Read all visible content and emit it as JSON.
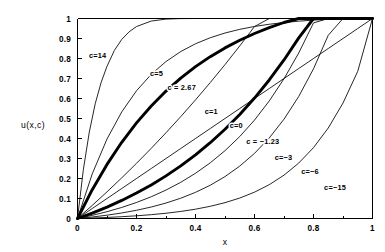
{
  "figure": {
    "name": "utility-function-family-plot",
    "background_color": "#ffffff",
    "foreground_color": "#000000"
  },
  "chart_data": {
    "type": "line",
    "title": "",
    "subtitle": "",
    "xlabel": "x",
    "ylabel": "u(x,c)",
    "xlim": [
      0,
      1
    ],
    "ylim": [
      0,
      1
    ],
    "grid": false,
    "legend_position": "inline-curve-labels",
    "x_ticks": [
      "0",
      "0.2",
      "0.4",
      "0.6",
      "0.8",
      "1"
    ],
    "x_tick_values": [
      0,
      0.2,
      0.4,
      0.6,
      0.8,
      1
    ],
    "x_minor_tick_values": [
      0.1,
      0.3,
      0.5,
      0.7,
      0.9
    ],
    "y_ticks": [
      "0",
      "0.1",
      "0.2",
      "0.3",
      "0.4",
      "0.5",
      "0.6",
      "0.7",
      "0.8",
      "0.9",
      "1"
    ],
    "y_tick_values": [
      0,
      0.1,
      0.2,
      0.3,
      0.4,
      0.5,
      0.6,
      0.7,
      0.8,
      0.9,
      1
    ],
    "series": [
      {
        "name": "c=14",
        "label": "c=14",
        "c": 14,
        "bold": false,
        "label_x": 0.075,
        "label_y": 0.805,
        "label_dx": -2,
        "label_dy": 0,
        "x": [
          0,
          0.02,
          0.04,
          0.06,
          0.08,
          0.1,
          0.125,
          0.15,
          0.175,
          0.2,
          0.25,
          0.3,
          0.35,
          0.4,
          0.45,
          0.5,
          0.6,
          0.7,
          0.8,
          0.9,
          1
        ],
        "y": [
          0,
          0.2461,
          0.4323,
          0.5733,
          0.68,
          0.7608,
          0.8405,
          0.8955,
          0.9335,
          0.9598,
          0.9873,
          0.997,
          0.9996,
          1.0,
          1.0,
          1.0,
          1.0,
          1.0,
          1.0,
          1.0,
          1.0
        ]
      },
      {
        "name": "c=5",
        "label": "c=5",
        "c": 5,
        "bold": false,
        "label_x": 0.275,
        "label_y": 0.715,
        "label_dx": -2,
        "label_dy": 0,
        "x": [
          0,
          0.05,
          0.1,
          0.15,
          0.2,
          0.25,
          0.3,
          0.35,
          0.4,
          0.45,
          0.5,
          0.55,
          0.6,
          0.65,
          0.7,
          0.75,
          0.8,
          0.85,
          0.9,
          0.95,
          1
        ],
        "y": [
          0,
          0.2235,
          0.3975,
          0.5331,
          0.6387,
          0.7209,
          0.7849,
          0.8348,
          0.8736,
          0.9039,
          0.9274,
          0.9458,
          0.9601,
          0.9712,
          0.9799,
          0.9866,
          0.9919,
          0.996,
          0.9992,
          1.0,
          1.0
        ]
      },
      {
        "name": "c=2.67",
        "label": "c = 2.67",
        "c": 2.67,
        "bold": true,
        "label_x": 0.36,
        "label_y": 0.645,
        "label_dx": -2,
        "label_dy": 0,
        "x": [
          0,
          0.05,
          0.1,
          0.15,
          0.2,
          0.25,
          0.3,
          0.35,
          0.4,
          0.45,
          0.5,
          0.55,
          0.6,
          0.65,
          0.7,
          0.75,
          0.8,
          0.85,
          0.9,
          0.95,
          1
        ],
        "y": [
          0,
          0.1442,
          0.2705,
          0.3811,
          0.478,
          0.5628,
          0.6372,
          0.7023,
          0.7594,
          0.8093,
          0.853,
          0.8913,
          0.9249,
          0.9543,
          0.98,
          1.0026,
          1.0223,
          1.0396,
          1.0548,
          1.0681,
          1.0
        ]
      },
      {
        "name": "c=1",
        "label": "c=1",
        "c": 1,
        "bold": false,
        "label_x": 0.46,
        "label_y": 0.525,
        "label_dx": -2,
        "label_dy": 0,
        "x": [
          0,
          0.05,
          0.1,
          0.15,
          0.2,
          0.25,
          0.3,
          0.35,
          0.4,
          0.45,
          0.5,
          0.55,
          0.6,
          0.65,
          0.7,
          0.75,
          0.8,
          0.85,
          0.9,
          0.95,
          1
        ],
        "y": [
          0,
          0.0656,
          0.1333,
          0.2034,
          0.2759,
          0.351,
          0.4288,
          0.5094,
          0.593,
          0.6797,
          0.7696,
          0.8629,
          0.9598,
          1.0,
          1.0,
          1.0,
          1.0,
          1.0,
          1.0,
          1.0,
          1.0
        ]
      },
      {
        "name": "c=0",
        "label": "c=0",
        "c": 0,
        "bold": false,
        "label_x": 0.545,
        "label_y": 0.455,
        "label_dx": -2,
        "label_dy": 0,
        "x": [
          0,
          0.05,
          0.1,
          0.15,
          0.2,
          0.25,
          0.3,
          0.35,
          0.4,
          0.45,
          0.5,
          0.55,
          0.6,
          0.65,
          0.7,
          0.75,
          0.8,
          0.85,
          0.9,
          0.95,
          1
        ],
        "y": [
          0,
          0.05,
          0.1,
          0.15,
          0.2,
          0.25,
          0.3,
          0.35,
          0.4,
          0.45,
          0.5,
          0.55,
          0.6,
          0.65,
          0.7,
          0.75,
          0.8,
          0.85,
          0.9,
          0.95,
          1
        ]
      },
      {
        "name": "c=-1.23",
        "label": "c = −1.23",
        "c": -1.23,
        "bold": true,
        "label_x": 0.635,
        "label_y": 0.375,
        "label_dx": -2,
        "label_dy": 0,
        "x": [
          0,
          0.05,
          0.1,
          0.15,
          0.2,
          0.25,
          0.3,
          0.35,
          0.4,
          0.45,
          0.5,
          0.55,
          0.6,
          0.65,
          0.7,
          0.75,
          0.8,
          0.85,
          0.9,
          0.95,
          1
        ],
        "y": [
          0,
          0.027,
          0.057,
          0.0903,
          0.1272,
          0.168,
          0.2131,
          0.263,
          0.3181,
          0.3789,
          0.4461,
          0.5203,
          0.6022,
          0.6927,
          0.7927,
          0.9031,
          1.0,
          1.0,
          1.0,
          1.0,
          1.0
        ]
      },
      {
        "name": "c=-3",
        "label": "c=−3",
        "c": -3,
        "bold": false,
        "label_x": 0.705,
        "label_y": 0.295,
        "label_dx": -2,
        "label_dy": 0,
        "x": [
          0,
          0.05,
          0.1,
          0.15,
          0.2,
          0.25,
          0.3,
          0.35,
          0.4,
          0.45,
          0.5,
          0.55,
          0.6,
          0.65,
          0.7,
          0.75,
          0.8,
          0.85,
          0.9,
          0.95,
          1
        ],
        "y": [
          0,
          0.0157,
          0.034,
          0.0553,
          0.0801,
          0.1088,
          0.1422,
          0.181,
          0.2261,
          0.2784,
          0.3392,
          0.4099,
          0.4921,
          0.5877,
          0.6987,
          0.8278,
          0.9779,
          1.0,
          1.0,
          1.0,
          1.0
        ]
      },
      {
        "name": "c=-6",
        "label": "c=−6",
        "c": -6,
        "bold": false,
        "label_x": 0.795,
        "label_y": 0.225,
        "label_dx": -2,
        "label_dy": 0,
        "x": [
          0,
          0.05,
          0.1,
          0.15,
          0.2,
          0.25,
          0.3,
          0.35,
          0.4,
          0.45,
          0.5,
          0.55,
          0.6,
          0.65,
          0.7,
          0.75,
          0.8,
          0.85,
          0.9,
          0.95,
          1
        ],
        "y": [
          0,
          0.0075,
          0.0166,
          0.0276,
          0.0411,
          0.0574,
          0.0773,
          0.1015,
          0.1308,
          0.1664,
          0.2096,
          0.262,
          0.3256,
          0.4028,
          0.4966,
          0.6104,
          0.7485,
          0.9162,
          1.0,
          1.0,
          1.0
        ]
      },
      {
        "name": "c=-15",
        "label": "c=−15",
        "c": -15,
        "bold": false,
        "label_x": 0.88,
        "label_y": 0.145,
        "label_dx": -2,
        "label_dy": 0,
        "x": [
          0,
          0.05,
          0.1,
          0.15,
          0.2,
          0.25,
          0.3,
          0.35,
          0.4,
          0.45,
          0.5,
          0.55,
          0.6,
          0.65,
          0.7,
          0.75,
          0.8,
          0.85,
          0.9,
          0.95,
          1
        ],
        "y": [
          0,
          0.0024,
          0.0053,
          0.009,
          0.0135,
          0.0192,
          0.0263,
          0.0353,
          0.0466,
          0.061,
          0.0792,
          0.1023,
          0.1317,
          0.1691,
          0.2167,
          0.2773,
          0.3544,
          0.4525,
          0.5773,
          0.7361,
          1.0
        ]
      }
    ]
  }
}
